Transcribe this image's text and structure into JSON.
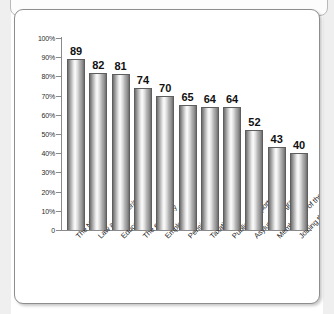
{
  "chart_data": {
    "type": "bar",
    "title": "",
    "subtitle": "",
    "xlabel": "",
    "ylabel": "",
    "ylim": [
      0,
      100
    ],
    "grid": false,
    "legend": "none",
    "y_tick_labels": [
      "100%",
      "90%",
      "80%",
      "70%",
      "60%",
      "50%",
      "40%",
      "30%",
      "20%",
      "10%",
      "0"
    ],
    "y_tick_values": [
      100,
      90,
      80,
      70,
      60,
      50,
      40,
      30,
      20,
      10,
      0
    ],
    "categories": [
      "The NHS",
      "Law and order/crime",
      "Education",
      "The economy",
      "Employment",
      "Pensions",
      "Taxation",
      "Public transport",
      "Asylum/immigration",
      "Membership of the EU",
      "Joining the euro"
    ],
    "values": [
      89,
      82,
      81,
      74,
      70,
      65,
      64,
      64,
      52,
      43,
      40
    ],
    "value_labels": [
      "89",
      "82",
      "81",
      "74",
      "70",
      "65",
      "64",
      "64",
      "52",
      "43",
      "40"
    ],
    "colors": {
      "bar_light": "#fbfbfb",
      "bar_mid": "#bcbcbc",
      "bar_dark": "#6f6f6f",
      "bar_outline": "#5e5e5e",
      "axis": "#8a8a8a",
      "text": "#242424",
      "panel_background": "#ffffff",
      "panel_border": "#8d8d8d"
    }
  }
}
